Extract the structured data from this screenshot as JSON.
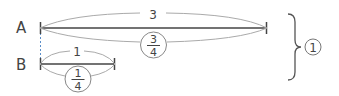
{
  "diagram": {
    "tape_a": {
      "label": "A",
      "top_value": "3",
      "bottom_fraction": {
        "numerator": "3",
        "denominator": "4"
      }
    },
    "tape_b": {
      "label": "B",
      "top_value": "1",
      "bottom_fraction": {
        "numerator": "1",
        "denominator": "4"
      }
    },
    "brace_marker": "1"
  },
  "colors": {
    "line": "#444444",
    "arc": "#999999",
    "dash": "#5b8ec9"
  }
}
